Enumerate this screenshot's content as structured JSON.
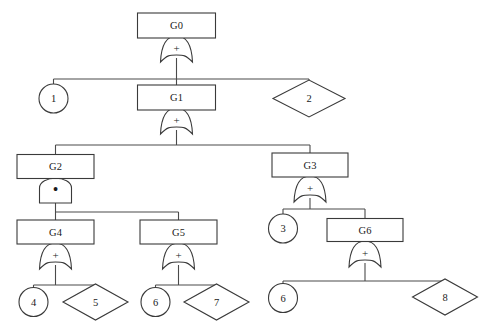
{
  "diagram": {
    "type": "fault-tree",
    "background_color": "#ffffff",
    "line_color": "#4a4a4a",
    "shape_stroke_color": "#3a3a3a",
    "shape_fill_color": "#ffffff",
    "text_color": "#1a1a1a",
    "width": 493,
    "height": 334
  },
  "legend": {
    "or_gate_symbol": "+",
    "and_gate_symbol": "•",
    "rectangle_meaning": "intermediate-event",
    "circle_meaning": "basic-event",
    "diamond_meaning": "undeveloped-event"
  },
  "nodes": [
    {
      "id": "G0",
      "label": "G0",
      "shape": "rect",
      "x": 176.5,
      "y": 25.5,
      "w": 78,
      "h": 25
    },
    {
      "id": "G1",
      "label": "G1",
      "shape": "rect",
      "x": 176.5,
      "y": 97.5,
      "w": 78,
      "h": 25
    },
    {
      "id": "E1",
      "label": "1",
      "shape": "circle",
      "x": 53.5,
      "y": 98.5,
      "r": 14.5
    },
    {
      "id": "E2",
      "label": "2",
      "shape": "diamond",
      "x": 309,
      "y": 98.5,
      "w": 72,
      "h": 37
    },
    {
      "id": "G2",
      "label": "G2",
      "shape": "rect",
      "x": 55.5,
      "y": 166.5,
      "w": 77,
      "h": 24
    },
    {
      "id": "G3",
      "label": "G3",
      "shape": "rect",
      "x": 310,
      "y": 165,
      "w": 76,
      "h": 24
    },
    {
      "id": "G4",
      "label": "G4",
      "shape": "rect",
      "x": 55.5,
      "y": 232,
      "w": 77,
      "h": 24
    },
    {
      "id": "G5",
      "label": "G5",
      "shape": "rect",
      "x": 178.5,
      "y": 232,
      "w": 77,
      "h": 24
    },
    {
      "id": "E3",
      "label": "3",
      "shape": "circle",
      "x": 283,
      "y": 228.5,
      "r": 14.5
    },
    {
      "id": "G6",
      "label": "G6",
      "shape": "rect",
      "x": 365,
      "y": 230,
      "w": 76,
      "h": 23
    },
    {
      "id": "E4",
      "label": "4",
      "shape": "circle",
      "x": 33.5,
      "y": 302,
      "r": 14.5
    },
    {
      "id": "E5",
      "label": "5",
      "shape": "diamond",
      "x": 95.5,
      "y": 302,
      "w": 65,
      "h": 36
    },
    {
      "id": "E6",
      "label": "6",
      "shape": "circle",
      "x": 155.5,
      "y": 302,
      "r": 14.5
    },
    {
      "id": "E7",
      "label": "7",
      "shape": "diamond",
      "x": 216.5,
      "y": 302,
      "w": 65,
      "h": 36
    },
    {
      "id": "E8",
      "label": "6",
      "shape": "circle",
      "x": 283,
      "y": 298,
      "r": 14.5
    },
    {
      "id": "E9",
      "label": "8",
      "shape": "diamond",
      "x": 445,
      "y": 297,
      "w": 65,
      "h": 36
    }
  ],
  "gates": [
    {
      "id": "gate-G0",
      "parent": "G0",
      "type": "or",
      "symbol": "+",
      "x": 176.5,
      "y": 49,
      "bus_y": 79,
      "children": [
        "E1",
        "G1",
        "E2"
      ]
    },
    {
      "id": "gate-G1",
      "parent": "G1",
      "type": "or",
      "symbol": "+",
      "x": 176.5,
      "y": 121,
      "bus_y": 145,
      "children": [
        "G2",
        "G3"
      ]
    },
    {
      "id": "gate-G2",
      "parent": "G2",
      "type": "and",
      "symbol": "•",
      "x": 55.5,
      "y": 190,
      "bus_y": 212,
      "children": [
        "G4",
        "G5"
      ]
    },
    {
      "id": "gate-G3",
      "parent": "G3",
      "type": "or",
      "symbol": "+",
      "x": 310,
      "y": 189,
      "bus_y": 209,
      "children": [
        "E3",
        "G6"
      ]
    },
    {
      "id": "gate-G4",
      "parent": "G4",
      "type": "or",
      "symbol": "+",
      "x": 55.5,
      "y": 256,
      "bus_y": 285,
      "children": [
        "E4",
        "E5"
      ]
    },
    {
      "id": "gate-G5",
      "parent": "G5",
      "type": "or",
      "symbol": "+",
      "x": 178.5,
      "y": 256,
      "bus_y": 285,
      "children": [
        "E6",
        "E7"
      ]
    },
    {
      "id": "gate-G6",
      "parent": "G6",
      "type": "or",
      "symbol": "+",
      "x": 365,
      "y": 254,
      "bus_y": 281,
      "children": [
        "E8",
        "E9"
      ]
    }
  ],
  "gate_geometry": {
    "half_width": 16,
    "height": 26,
    "stem_up": 11,
    "stem_down": 12
  }
}
